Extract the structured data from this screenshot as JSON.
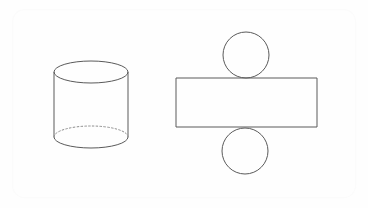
{
  "figure": {
    "title": "Cylinder and its net",
    "background_color": "#fefefe",
    "frame": {
      "name": "rounded-card-border",
      "x": 12,
      "y": 9,
      "width": 344,
      "height": 189,
      "corner_radius": 12,
      "stroke_color": "#fbfbfb"
    },
    "stroke_color": "#5a5a5a",
    "hidden_stroke_color": "#8d8d8d",
    "shapes": [
      {
        "name": "cylinder-3d",
        "label": "Cylinder",
        "type": "cylinder",
        "center_x": 91,
        "left_x": 54,
        "right_x": 128,
        "radius_x": 37,
        "radius_y": 11,
        "top_center_y": 72,
        "bottom_center_y": 137,
        "height": 65,
        "has_hidden_back_edge": true
      },
      {
        "name": "net-top-circle",
        "label": "Top base circle",
        "type": "circle",
        "center_x": 246,
        "center_y": 55,
        "radius": 23
      },
      {
        "name": "net-lateral-rectangle",
        "label": "Lateral surface rectangle",
        "type": "rectangle",
        "x": 176,
        "y": 78,
        "width": 141,
        "height": 49
      },
      {
        "name": "net-bottom-circle",
        "label": "Bottom base circle",
        "type": "circle",
        "center_x": 245,
        "center_y": 151,
        "radius": 23
      }
    ]
  }
}
